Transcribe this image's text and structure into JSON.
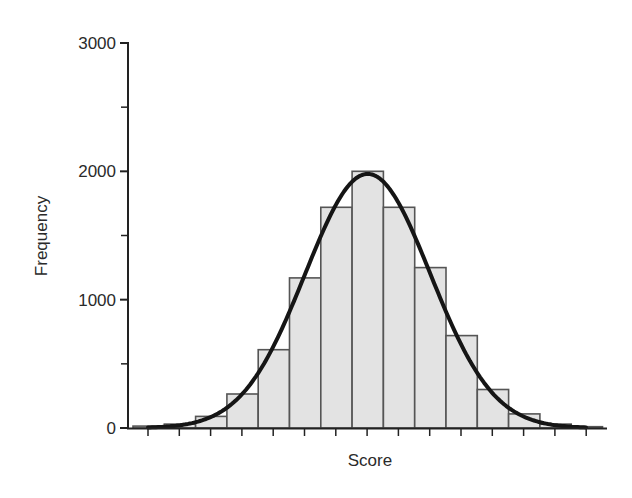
{
  "chart_data": {
    "type": "bar",
    "subtype": "histogram_with_normal_curve",
    "title": "",
    "xlabel": "Score",
    "ylabel": "Frequency",
    "ylim": [
      0,
      3000
    ],
    "yticks": [
      0,
      1000,
      2000,
      3000
    ],
    "yticks_minor": [
      500,
      1500,
      2500
    ],
    "xtick_labels": [],
    "grid": false,
    "legend": null,
    "bins": 15,
    "categories": [
      "bin1",
      "bin2",
      "bin3",
      "bin4",
      "bin5",
      "bin6",
      "bin7",
      "bin8",
      "bin9",
      "bin10",
      "bin11",
      "bin12",
      "bin13",
      "bin14",
      "bin15"
    ],
    "values": [
      15,
      30,
      90,
      265,
      610,
      1170,
      1720,
      2000,
      1720,
      1250,
      720,
      300,
      110,
      30,
      10
    ],
    "series": [
      {
        "name": "Histogram",
        "type": "bar",
        "values": [
          15,
          30,
          90,
          265,
          610,
          1170,
          1720,
          2000,
          1720,
          1250,
          720,
          300,
          110,
          30,
          10
        ]
      },
      {
        "name": "Normal curve",
        "type": "line",
        "peak": 1980,
        "peak_bin_index": 7,
        "sd_in_bins": 2.0
      }
    ],
    "colors": {
      "bar_fill": "#e3e3e3",
      "bar_stroke": "#555555",
      "curve": "#151515",
      "axis": "#222222"
    }
  }
}
